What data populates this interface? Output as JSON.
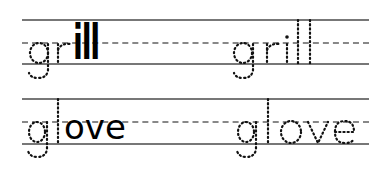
{
  "worksheet": {
    "rows": [
      {
        "example": {
          "traced": "gr",
          "solid": "ill"
        },
        "practice": "grill"
      },
      {
        "example": {
          "traced": "gl",
          "solid": "ove"
        },
        "practice": "glove"
      }
    ]
  }
}
